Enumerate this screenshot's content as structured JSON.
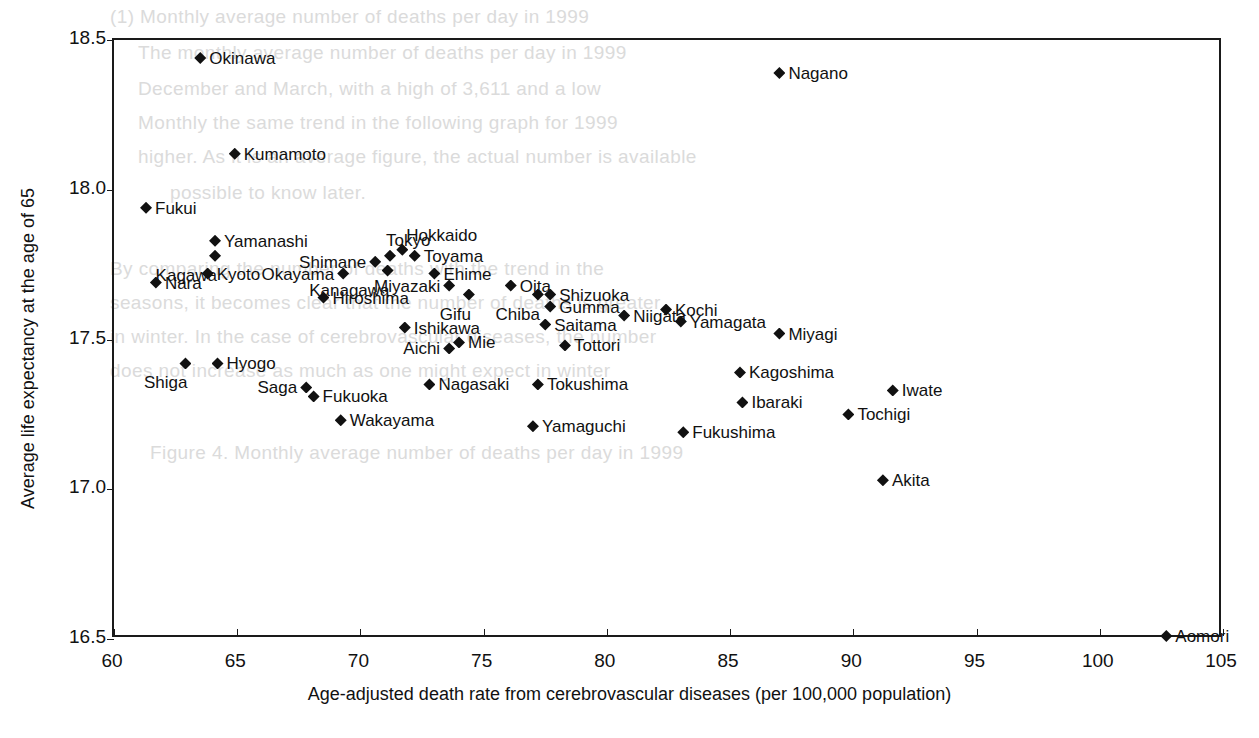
{
  "chart_data": {
    "type": "scatter",
    "title": "",
    "xlabel": "Age-adjusted death rate from cerebrovascular diseases (per 100,000 population)",
    "ylabel": "Average life expectancy at the age of 65",
    "xlim": [
      60,
      105
    ],
    "ylim": [
      16.5,
      18.5
    ],
    "xticks": [
      "60",
      "65",
      "70",
      "75",
      "80",
      "85",
      "90",
      "95",
      "100",
      "105"
    ],
    "yticks": [
      "16.5",
      "17.0",
      "17.5",
      "18.0",
      "18.5"
    ],
    "grid": false,
    "legend": "none",
    "marker": "filled-diamond",
    "marker_color": "#111111",
    "points": [
      {
        "label": "Okinawa",
        "x": 63.5,
        "y": 18.44,
        "pos": "right"
      },
      {
        "label": "Kumamoto",
        "x": 64.9,
        "y": 18.12,
        "pos": "right"
      },
      {
        "label": "Fukui",
        "x": 61.3,
        "y": 17.94,
        "pos": "right"
      },
      {
        "label": "Yamanashi",
        "x": 64.1,
        "y": 17.83,
        "pos": "right"
      },
      {
        "label": "Kagawa",
        "x": 64.1,
        "y": 17.78,
        "pos": "below-left"
      },
      {
        "label": "Kyoto",
        "x": 63.8,
        "y": 17.72,
        "pos": "right"
      },
      {
        "label": "Nara",
        "x": 61.7,
        "y": 17.69,
        "pos": "right"
      },
      {
        "label": "Okayama",
        "x": 69.3,
        "y": 17.72,
        "pos": "left"
      },
      {
        "label": "Shimane",
        "x": 70.6,
        "y": 17.76,
        "pos": "left"
      },
      {
        "label": "Hiroshima",
        "x": 68.5,
        "y": 17.64,
        "pos": "right"
      },
      {
        "label": "Tokyo",
        "x": 71.2,
        "y": 17.78,
        "pos": "above"
      },
      {
        "label": "Hokkaido",
        "x": 71.7,
        "y": 17.8,
        "pos": "above-right"
      },
      {
        "label": "Toyama",
        "x": 72.2,
        "y": 17.78,
        "pos": "right"
      },
      {
        "label": "Kanagawa",
        "x": 71.1,
        "y": 17.73,
        "pos": "below-left"
      },
      {
        "label": "Ehime",
        "x": 73.0,
        "y": 17.72,
        "pos": "right"
      },
      {
        "label": "Miyazaki",
        "x": 73.6,
        "y": 17.68,
        "pos": "left"
      },
      {
        "label": "Gifu",
        "x": 74.4,
        "y": 17.65,
        "pos": "below-left"
      },
      {
        "label": "Oita",
        "x": 76.1,
        "y": 17.68,
        "pos": "right"
      },
      {
        "label": "Chiba",
        "x": 77.2,
        "y": 17.65,
        "pos": "below-left"
      },
      {
        "label": "Shizuoka",
        "x": 77.7,
        "y": 17.65,
        "pos": "right"
      },
      {
        "label": "Gumma",
        "x": 77.7,
        "y": 17.61,
        "pos": "right"
      },
      {
        "label": "Niigata",
        "x": 80.7,
        "y": 17.58,
        "pos": "right"
      },
      {
        "label": "Kochi",
        "x": 82.4,
        "y": 17.6,
        "pos": "right"
      },
      {
        "label": "Yamagata",
        "x": 83.0,
        "y": 17.56,
        "pos": "right"
      },
      {
        "label": "Miyagi",
        "x": 87.0,
        "y": 17.52,
        "pos": "right"
      },
      {
        "label": "Ishikawa",
        "x": 71.8,
        "y": 17.54,
        "pos": "right"
      },
      {
        "label": "Mie",
        "x": 74.0,
        "y": 17.49,
        "pos": "right"
      },
      {
        "label": "Aichi",
        "x": 73.6,
        "y": 17.47,
        "pos": "left"
      },
      {
        "label": "Saitama",
        "x": 77.5,
        "y": 17.55,
        "pos": "right"
      },
      {
        "label": "Tottori",
        "x": 78.3,
        "y": 17.48,
        "pos": "right"
      },
      {
        "label": "Shiga",
        "x": 62.9,
        "y": 17.42,
        "pos": "below-left"
      },
      {
        "label": "Hyogo",
        "x": 64.2,
        "y": 17.42,
        "pos": "right"
      },
      {
        "label": "Saga",
        "x": 67.8,
        "y": 17.34,
        "pos": "left"
      },
      {
        "label": "Fukuoka",
        "x": 68.1,
        "y": 17.31,
        "pos": "right"
      },
      {
        "label": "Wakayama",
        "x": 69.2,
        "y": 17.23,
        "pos": "right"
      },
      {
        "label": "Nagasaki",
        "x": 72.8,
        "y": 17.35,
        "pos": "right"
      },
      {
        "label": "Tokushima",
        "x": 77.2,
        "y": 17.35,
        "pos": "right"
      },
      {
        "label": "Yamaguchi",
        "x": 77.0,
        "y": 17.21,
        "pos": "right"
      },
      {
        "label": "Fukushima",
        "x": 83.1,
        "y": 17.19,
        "pos": "right"
      },
      {
        "label": "Ibaraki",
        "x": 85.5,
        "y": 17.29,
        "pos": "right"
      },
      {
        "label": "Kagoshima",
        "x": 85.4,
        "y": 17.39,
        "pos": "right"
      },
      {
        "label": "Tochigi",
        "x": 89.8,
        "y": 17.25,
        "pos": "right"
      },
      {
        "label": "Iwate",
        "x": 91.6,
        "y": 17.33,
        "pos": "right"
      },
      {
        "label": "Akita",
        "x": 91.2,
        "y": 17.03,
        "pos": "right"
      },
      {
        "label": "Nagano",
        "x": 87.0,
        "y": 18.39,
        "pos": "right"
      },
      {
        "label": "Aomori",
        "x": 102.7,
        "y": 16.51,
        "pos": "right"
      }
    ]
  },
  "bleed_through": [
    {
      "text": "(1) Monthly average number of deaths per day in 1999",
      "x": 110,
      "y": 6
    },
    {
      "text": "The monthly average number of deaths per day in 1999",
      "x": 138,
      "y": 42
    },
    {
      "text": "December and March, with a high of 3,611 and a low",
      "x": 138,
      "y": 78
    },
    {
      "text": "Monthly the same trend in the following graph for 1999",
      "x": 138,
      "y": 112
    },
    {
      "text": "higher. As it is an average figure, the actual number is available",
      "x": 138,
      "y": 146
    },
    {
      "text": "possible to know later.",
      "x": 170,
      "y": 182
    },
    {
      "text": "By comparing the number of deaths with the trend in the",
      "x": 110,
      "y": 258
    },
    {
      "text": "seasons, it becomes clear that the number of deaths is greater",
      "x": 110,
      "y": 292
    },
    {
      "text": "in winter. In the case of cerebrovascular diseases, the number",
      "x": 110,
      "y": 326
    },
    {
      "text": "does not increase as much as one might expect in winter",
      "x": 110,
      "y": 360
    },
    {
      "text": "Figure 4. Monthly average number of deaths per day in 1999",
      "x": 150,
      "y": 442
    }
  ]
}
